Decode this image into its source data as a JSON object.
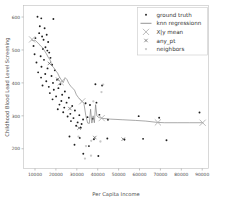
{
  "axes": {
    "xlabel": "Per Capita Income",
    "ylabel": "Childhood Blood Lead Level Screening",
    "xticks": [
      "10000",
      "20000",
      "30000",
      "40000",
      "50000",
      "60000",
      "70000",
      "80000",
      "90000"
    ],
    "yticks": [
      "200",
      "300",
      "400",
      "500",
      "600"
    ]
  },
  "legend": {
    "items": [
      {
        "label": "ground truth",
        "marker": "dot-small",
        "color": "#1f1f1f"
      },
      {
        "label": "knn regressionn",
        "marker": "line",
        "color": "#7a7a7a"
      },
      {
        "label": "X|y mean",
        "marker": "x-large",
        "color": "#a9a9a9"
      },
      {
        "label": "any_pt",
        "marker": "x-small",
        "color": "#555555"
      },
      {
        "label": "neighbors",
        "marker": "dot-faint",
        "color": "#b5b5b5"
      }
    ]
  },
  "chart_data": {
    "type": "scatter",
    "title": "",
    "xlabel": "Per Capita Income",
    "ylabel": "Childhood Blood Lead Level Screening",
    "xlim": [
      4500,
      93000
    ],
    "ylim": [
      140,
      635
    ],
    "grid": false,
    "legend_position": "upper right",
    "series": [
      {
        "name": "ground truth",
        "type": "scatter",
        "marker": "dot-small",
        "color": "#1f1f1f",
        "points": [
          [
            11200,
            601
          ],
          [
            13000,
            596
          ],
          [
            18800,
            594
          ],
          [
            12300,
            572
          ],
          [
            14600,
            566
          ],
          [
            12000,
            551
          ],
          [
            15600,
            546
          ],
          [
            13400,
            541
          ],
          [
            10200,
            536
          ],
          [
            14100,
            531
          ],
          [
            16300,
            524
          ],
          [
            9300,
            512
          ],
          [
            15000,
            508
          ],
          [
            13800,
            503
          ],
          [
            15900,
            498
          ],
          [
            16800,
            492
          ],
          [
            9800,
            487
          ],
          [
            12700,
            481
          ],
          [
            17400,
            476
          ],
          [
            14300,
            470
          ],
          [
            10700,
            462
          ],
          [
            18200,
            455
          ],
          [
            13100,
            449
          ],
          [
            16000,
            444
          ],
          [
            19500,
            438
          ],
          [
            11500,
            432
          ],
          [
            14900,
            427
          ],
          [
            17900,
            421
          ],
          [
            12900,
            416
          ],
          [
            20600,
            410
          ],
          [
            15400,
            405
          ],
          [
            18600,
            400
          ],
          [
            22100,
            396
          ],
          [
            13600,
            392
          ],
          [
            16600,
            388
          ],
          [
            21200,
            384
          ],
          [
            19000,
            379
          ],
          [
            24300,
            374
          ],
          [
            17100,
            369
          ],
          [
            23000,
            364
          ],
          [
            20100,
            359
          ],
          [
            26200,
            355
          ],
          [
            18400,
            350
          ],
          [
            22600,
            345
          ],
          [
            25100,
            340
          ],
          [
            21700,
            334
          ],
          [
            27800,
            330
          ],
          [
            24000,
            325
          ],
          [
            20900,
            320
          ],
          [
            29100,
            316
          ],
          [
            23500,
            311
          ],
          [
            26900,
            306
          ],
          [
            31200,
            302
          ],
          [
            25600,
            298
          ],
          [
            28400,
            293
          ],
          [
            33000,
            289
          ],
          [
            27200,
            284
          ],
          [
            30400,
            280
          ],
          [
            35100,
            296
          ],
          [
            32300,
            275
          ],
          [
            37600,
            291
          ],
          [
            29700,
            270
          ],
          [
            38900,
            396
          ],
          [
            42100,
            392
          ],
          [
            39400,
            340
          ],
          [
            44900,
            288
          ],
          [
            34200,
            338
          ],
          [
            36300,
            333
          ],
          [
            31900,
            264
          ],
          [
            40800,
            303
          ],
          [
            59600,
            299
          ],
          [
            69400,
            294
          ],
          [
            88700,
            310
          ],
          [
            26500,
            237
          ],
          [
            31400,
            233
          ],
          [
            38200,
            229
          ],
          [
            44600,
            231
          ],
          [
            52800,
            228
          ],
          [
            61700,
            230
          ],
          [
            72900,
            226
          ],
          [
            28900,
            212
          ],
          [
            35800,
            208
          ],
          [
            33100,
            185
          ],
          [
            40300,
            178
          ]
        ]
      },
      {
        "name": "knn regressionn",
        "type": "line",
        "color": "#7a7a7a",
        "points": [
          [
            8200,
            531
          ],
          [
            9100,
            528
          ],
          [
            10000,
            530
          ],
          [
            10900,
            524
          ],
          [
            11800,
            519
          ],
          [
            12700,
            512
          ],
          [
            13600,
            507
          ],
          [
            14500,
            498
          ],
          [
            15400,
            489
          ],
          [
            16300,
            478
          ],
          [
            17200,
            470
          ],
          [
            18100,
            452
          ],
          [
            19000,
            446
          ],
          [
            19900,
            437
          ],
          [
            20800,
            430
          ],
          [
            21700,
            418
          ],
          [
            22600,
            409
          ],
          [
            23500,
            401
          ],
          [
            24400,
            416
          ],
          [
            25300,
            410
          ],
          [
            26200,
            398
          ],
          [
            27100,
            390
          ],
          [
            28000,
            384
          ],
          [
            28900,
            378
          ],
          [
            29800,
            364
          ],
          [
            30700,
            356
          ],
          [
            31600,
            349
          ],
          [
            32500,
            344
          ],
          [
            33400,
            338
          ],
          [
            34300,
            301
          ],
          [
            35200,
            278
          ],
          [
            36000,
            277
          ],
          [
            36600,
            320
          ],
          [
            37200,
            278
          ],
          [
            37800,
            300
          ],
          [
            38400,
            279
          ],
          [
            39000,
            334
          ],
          [
            39600,
            300
          ],
          [
            40200,
            296
          ],
          [
            41000,
            294
          ],
          [
            42500,
            292
          ],
          [
            46000,
            290
          ],
          [
            52000,
            288
          ],
          [
            58000,
            286
          ],
          [
            63000,
            284
          ],
          [
            68500,
            280
          ],
          [
            72000,
            279
          ],
          [
            78000,
            279
          ],
          [
            84000,
            279
          ],
          [
            90500,
            279
          ]
        ]
      },
      {
        "name": "X|y mean",
        "type": "scatter",
        "marker": "x-large",
        "color": "#a9a9a9",
        "points": [
          [
            8600,
            532
          ],
          [
            22300,
            402
          ],
          [
            32600,
            344
          ],
          [
            41900,
            293
          ],
          [
            68800,
            280
          ],
          [
            90200,
            279
          ]
        ]
      },
      {
        "name": "any_pt",
        "type": "scatter",
        "marker": "x-small",
        "color": "#555555",
        "points": [
          [
            16900,
            459
          ],
          [
            20900,
            411
          ],
          [
            26700,
            322
          ],
          [
            31100,
            263
          ],
          [
            38600,
            234
          ],
          [
            52200,
            229
          ]
        ]
      },
      {
        "name": "neighbors",
        "type": "scatter",
        "marker": "dot-faint",
        "color": "#b5b5b5",
        "points": [
          [
            42600,
            395
          ],
          [
            41800,
            372
          ],
          [
            37900,
            344
          ],
          [
            30800,
            237
          ],
          [
            36900,
            224
          ],
          [
            41300,
            222
          ],
          [
            34400,
            208
          ],
          [
            36800,
            179
          ],
          [
            33900,
            170
          ]
        ]
      }
    ]
  }
}
